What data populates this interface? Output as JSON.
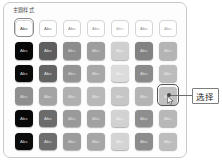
{
  "panel": {
    "title": "主题样式"
  },
  "grid": {
    "columns": 7,
    "rows": 6,
    "swatch_label": "Abc",
    "selected": {
      "row": 4,
      "col": 7
    },
    "first_cell_focused": {
      "row": 1,
      "col": 1
    },
    "cells": [
      [
        {
          "fill": "#ffffff",
          "text": "#3c3c3c",
          "style": "outline"
        },
        {
          "fill": "#ffffff",
          "text": "#6f6f6f",
          "style": "outline"
        },
        {
          "fill": "#ffffff",
          "text": "#8a8a8a",
          "style": "outline"
        },
        {
          "fill": "#ffffff",
          "text": "#9a9a9a",
          "style": "outline"
        },
        {
          "fill": "#ffffff",
          "text": "#b2b2b2",
          "style": "outline"
        },
        {
          "fill": "#ffffff",
          "text": "#8f8f8f",
          "style": "outline"
        },
        {
          "fill": "#ffffff",
          "text": "#a6a6a6",
          "style": "outline"
        }
      ],
      [
        {
          "fill": "#070707",
          "text": "#d8d8d8",
          "style": "filled"
        },
        {
          "fill": "#5e5e5e",
          "text": "#e2e2e2",
          "style": "filled"
        },
        {
          "fill": "#8c8c8c",
          "text": "#d6d6d6",
          "style": "filled"
        },
        {
          "fill": "#9d9d9d",
          "text": "#dcdcdc",
          "style": "filled"
        },
        {
          "fill": "#cfcfcf",
          "text": "#efefef",
          "style": "filled"
        },
        {
          "fill": "#828282",
          "text": "#dedede",
          "style": "filled"
        },
        {
          "fill": "#b4b4b4",
          "text": "#e4e4e4",
          "style": "filled"
        }
      ],
      [
        {
          "fill": "#0a0a0a",
          "text": "#d4d4d4",
          "style": "filled"
        },
        {
          "fill": "#636363",
          "text": "#e0e0e0",
          "style": "filled"
        },
        {
          "fill": "#949494",
          "text": "#d9d9d9",
          "style": "filled"
        },
        {
          "fill": "#a8a8a8",
          "text": "#dedede",
          "style": "filled"
        },
        {
          "fill": "#dcdcdc",
          "text": "#f1f1f1",
          "style": "filled"
        },
        {
          "fill": "#8a8a8a",
          "text": "#dedede",
          "style": "filled"
        },
        {
          "fill": "#bcbcbc",
          "text": "#e6e6e6",
          "style": "filled"
        }
      ],
      [
        {
          "fill": "#8f8f8f",
          "text": "#dadada",
          "style": "filled"
        },
        {
          "fill": "#a4a4a4",
          "text": "#e2e2e2",
          "style": "filled"
        },
        {
          "fill": "#b0b0b0",
          "text": "#e2e2e2",
          "style": "filled"
        },
        {
          "fill": "#b8b8b8",
          "text": "#e6e6e6",
          "style": "filled"
        },
        {
          "fill": "#c6c6c6",
          "text": "#ececec",
          "style": "filled"
        },
        {
          "fill": "#b4b4b4",
          "text": "#e4e4e4",
          "style": "filled"
        },
        {
          "fill": "#c0c0c0",
          "text": "#e8e8e8",
          "style": "filled"
        }
      ],
      [
        {
          "fill": "#080808",
          "text": "#d6d6d6",
          "style": "filled"
        },
        {
          "fill": "#6b6b6b",
          "text": "#e0e0e0",
          "style": "filled"
        },
        {
          "fill": "#9a9a9a",
          "text": "#dcdcdc",
          "style": "filled"
        },
        {
          "fill": "#a2a2a2",
          "text": "#dedede",
          "style": "filled"
        },
        {
          "fill": "#d2d2d2",
          "text": "#efefef",
          "style": "filled"
        },
        {
          "fill": "#8e8e8e",
          "text": "#dedede",
          "style": "filled"
        },
        {
          "fill": "#b8b8b8",
          "text": "#e6e6e6",
          "style": "filled"
        }
      ],
      [
        {
          "fill": "#0c0c0c",
          "text": "#d2d2d2",
          "style": "filled"
        },
        {
          "fill": "#6e6e6e",
          "text": "#dfdfdf",
          "style": "filled"
        },
        {
          "fill": "#9c9c9c",
          "text": "#dcdcdc",
          "style": "filled"
        },
        {
          "fill": "#a6a6a6",
          "text": "#e0e0e0",
          "style": "filled"
        },
        {
          "fill": "#d4d4d4",
          "text": "#f0f0f0",
          "style": "filled"
        },
        {
          "fill": "#8c8c8c",
          "text": "#dedede",
          "style": "filled"
        },
        {
          "fill": "#bdbdbd",
          "text": "#e7e7e7",
          "style": "filled"
        }
      ]
    ]
  },
  "callout": {
    "label": "选择"
  },
  "colors": {
    "panel_border": "#c9c9c9",
    "callout_border": "#7d7d7d",
    "leader_line": "#6d6d6d",
    "selection_ring": "#555555"
  }
}
